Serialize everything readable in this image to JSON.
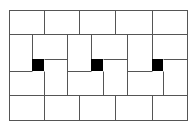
{
  "diagram": {
    "type": "tiling-pattern",
    "colors": {
      "background": "#ffffff",
      "line": "#555555",
      "fill_black": "#000000"
    },
    "frame": {
      "x": 9,
      "y": 10,
      "w": 178,
      "h": 110
    },
    "lines": [
      {
        "x1": 9,
        "y1": 34,
        "x2": 187,
        "y2": 34
      },
      {
        "x1": 9,
        "y1": 95,
        "x2": 187,
        "y2": 95
      },
      {
        "x1": 44,
        "y1": 10,
        "x2": 44,
        "y2": 34
      },
      {
        "x1": 79,
        "y1": 10,
        "x2": 79,
        "y2": 34
      },
      {
        "x1": 115,
        "y1": 10,
        "x2": 115,
        "y2": 34
      },
      {
        "x1": 152,
        "y1": 10,
        "x2": 152,
        "y2": 34
      },
      {
        "x1": 44,
        "y1": 95,
        "x2": 44,
        "y2": 120
      },
      {
        "x1": 79,
        "y1": 95,
        "x2": 79,
        "y2": 120
      },
      {
        "x1": 115,
        "y1": 95,
        "x2": 115,
        "y2": 120
      },
      {
        "x1": 152,
        "y1": 95,
        "x2": 152,
        "y2": 120
      },
      {
        "x1": 32,
        "y1": 34,
        "x2": 32,
        "y2": 59
      },
      {
        "x1": 44,
        "y1": 71,
        "x2": 44,
        "y2": 95
      },
      {
        "x1": 67,
        "y1": 34,
        "x2": 67,
        "y2": 95
      },
      {
        "x1": 91,
        "y1": 34,
        "x2": 91,
        "y2": 59
      },
      {
        "x1": 103,
        "y1": 71,
        "x2": 103,
        "y2": 95
      },
      {
        "x1": 127,
        "y1": 34,
        "x2": 127,
        "y2": 95
      },
      {
        "x1": 152,
        "y1": 34,
        "x2": 152,
        "y2": 59
      },
      {
        "x1": 163,
        "y1": 71,
        "x2": 163,
        "y2": 95
      },
      {
        "x1": 44,
        "y1": 59,
        "x2": 67,
        "y2": 59
      },
      {
        "x1": 103,
        "y1": 59,
        "x2": 127,
        "y2": 59
      },
      {
        "x1": 163,
        "y1": 59,
        "x2": 187,
        "y2": 59
      },
      {
        "x1": 9,
        "y1": 71,
        "x2": 32,
        "y2": 71
      },
      {
        "x1": 67,
        "y1": 71,
        "x2": 91,
        "y2": 71
      },
      {
        "x1": 127,
        "y1": 71,
        "x2": 152,
        "y2": 71
      }
    ],
    "black_squares": [
      {
        "x": 32,
        "y": 59,
        "w": 12,
        "h": 12
      },
      {
        "x": 91,
        "y": 59,
        "w": 12,
        "h": 12
      },
      {
        "x": 152,
        "y": 59,
        "w": 11,
        "h": 12
      }
    ]
  }
}
